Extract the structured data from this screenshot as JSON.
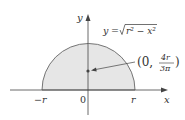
{
  "diagram": {
    "type": "semicircle-centroid",
    "curve_label": "y = √(r² − x²)",
    "curve_label_parts": {
      "lhs": "y",
      "eq": "=",
      "sqrt_body": "r² − x²"
    },
    "centroid_label": {
      "open": "(0,",
      "numerator": "4r",
      "denominator": "3π",
      "close": ")"
    },
    "axis_labels": {
      "x": "x",
      "y": "y"
    },
    "tick_labels": {
      "neg_r": "−r",
      "origin": "0",
      "pos_r": "r"
    },
    "colors": {
      "fill": "#e6e6e6",
      "stroke": "#555555",
      "axis": "#444444",
      "text": "#333333"
    }
  }
}
